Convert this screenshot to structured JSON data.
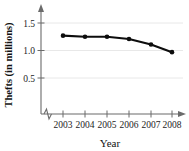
{
  "chart_data": {
    "type": "line",
    "title": "",
    "xlabel": "Year",
    "ylabel": "Thefts (in millions)",
    "categories": [
      "2003",
      "2004",
      "2005",
      "2006",
      "2007",
      "2008"
    ],
    "values": [
      1.27,
      1.25,
      1.25,
      1.21,
      1.11,
      0.97
    ],
    "series": [
      {
        "name": "Thefts",
        "values": [
          1.27,
          1.25,
          1.25,
          1.21,
          1.11,
          0.97
        ]
      }
    ],
    "ytick_labels": [
      "0.5",
      "1.0",
      "1.5"
    ],
    "ytick_values": [
      0.5,
      1.0,
      1.5
    ],
    "ylim": [
      0.22,
      1.62
    ],
    "xlim": [
      2002.45,
      2008.75
    ],
    "grid": true,
    "grid_orientation": "horizontal",
    "legend": "none",
    "axis_break_x": true,
    "marker": "circle",
    "line_color": "#0d0d0d",
    "grid_color": "#e2e2e2",
    "axis_color": "#6b6b6b"
  },
  "axes": {
    "y_title": "Thefts (in millions)",
    "x_title": "Year",
    "y_ticks": [
      {
        "label": "0.5",
        "value": 0.5
      },
      {
        "label": "1.0",
        "value": 1.0
      },
      {
        "label": "1.5",
        "value": 1.5
      }
    ],
    "x_ticks": [
      {
        "label": "2003",
        "value": 2003
      },
      {
        "label": "2004",
        "value": 2004
      },
      {
        "label": "2005",
        "value": 2005
      },
      {
        "label": "2006",
        "value": 2006
      },
      {
        "label": "2007",
        "value": 2007
      },
      {
        "label": "2008",
        "value": 2008
      }
    ]
  }
}
